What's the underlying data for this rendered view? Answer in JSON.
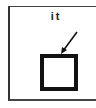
{
  "diagram": {
    "label": "it",
    "elements": {
      "frame": "open-frame (top, left, bottom borders)",
      "arrow": "arrow pointing down-left toward square's top edge",
      "square": "thick black hollow square"
    },
    "colors": {
      "stroke": "#111111",
      "frame": "#333333",
      "background": "#ffffff"
    }
  }
}
